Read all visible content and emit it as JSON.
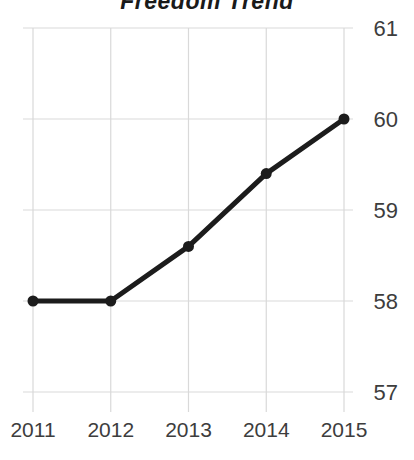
{
  "title": "Freedom Trend",
  "chart_data": {
    "type": "line",
    "title": "Freedom Trend",
    "x": [
      2011,
      2012,
      2013,
      2014,
      2015
    ],
    "x_tick_labels": [
      "2011",
      "2012",
      "2013",
      "2014",
      "2015"
    ],
    "values": [
      58.0,
      58.0,
      58.6,
      59.4,
      60.0
    ],
    "yticks": [
      57,
      58,
      59,
      60,
      61
    ],
    "ylim": [
      57,
      61
    ],
    "xlabel": "",
    "ylabel": "",
    "y_axis_side": "right",
    "grid": true,
    "legend": "none",
    "marker": "circle",
    "colors": {
      "line": "#1c1c1c",
      "marker": "#1c1c1c",
      "grid": "#d9d9d9",
      "tick_label": "#3d3d3d",
      "title": "#1a1a1a"
    }
  }
}
